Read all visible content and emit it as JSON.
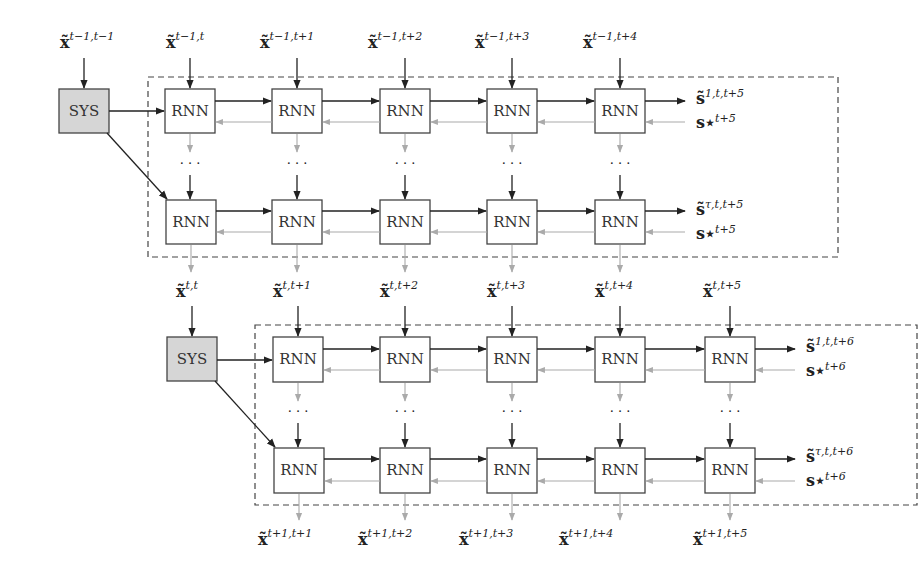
{
  "diagram": {
    "colors": {
      "sys_fill": "#d6d6d6",
      "box_stroke": "#444444",
      "forward_arrow": "#222222",
      "backward_arrow": "#aaaaaa",
      "dashed_border": "#444444"
    },
    "block_top": {
      "sys_input": {
        "base": "x̃",
        "sup": "t−1,t−1"
      },
      "sys_label": "SYS",
      "rnn_label": "RNN",
      "inputs": [
        {
          "base": "x̃",
          "sup": "t−1,t"
        },
        {
          "base": "x̃",
          "sup": "t−1,t+1"
        },
        {
          "base": "x̃",
          "sup": "t−1,t+2"
        },
        {
          "base": "x̃",
          "sup": "t−1,t+3"
        },
        {
          "base": "x̃",
          "sup": "t−1,t+4"
        }
      ],
      "row1_output": {
        "base": "s̃",
        "sup": "1,t,t+5"
      },
      "row1_target": {
        "base": "s⋆",
        "sup": "t+5"
      },
      "rowN_output": {
        "base": "s̃",
        "sup": "τ,t,t+5"
      },
      "rowN_target": {
        "base": "s⋆",
        "sup": "t+5"
      },
      "ellipsis": "· · ·"
    },
    "block_bottom": {
      "sys_input": {
        "base": "x̃",
        "sup": "t,t"
      },
      "sys_label": "SYS",
      "rnn_label": "RNN",
      "inputs": [
        {
          "base": "x̃",
          "sup": "t,t+1"
        },
        {
          "base": "x̃",
          "sup": "t,t+2"
        },
        {
          "base": "x̃",
          "sup": "t,t+3"
        },
        {
          "base": "x̃",
          "sup": "t,t+4"
        },
        {
          "base": "x̃",
          "sup": "t,t+5"
        }
      ],
      "row1_output": {
        "base": "s̃",
        "sup": "1,t,t+6"
      },
      "row1_target": {
        "base": "s⋆",
        "sup": "t+6"
      },
      "rowN_output": {
        "base": "s̃",
        "sup": "τ,t,t+6"
      },
      "rowN_target": {
        "base": "s⋆",
        "sup": "t+6"
      },
      "outputs": [
        {
          "base": "x̃",
          "sup": "t+1,t+1"
        },
        {
          "base": "x̃",
          "sup": "t+1,t+2"
        },
        {
          "base": "x̃",
          "sup": "t+1,t+3"
        },
        {
          "base": "x̃",
          "sup": "t+1,t+4"
        },
        {
          "base": "x̃",
          "sup": "t+1,t+5"
        }
      ],
      "ellipsis": "· · ·"
    }
  }
}
